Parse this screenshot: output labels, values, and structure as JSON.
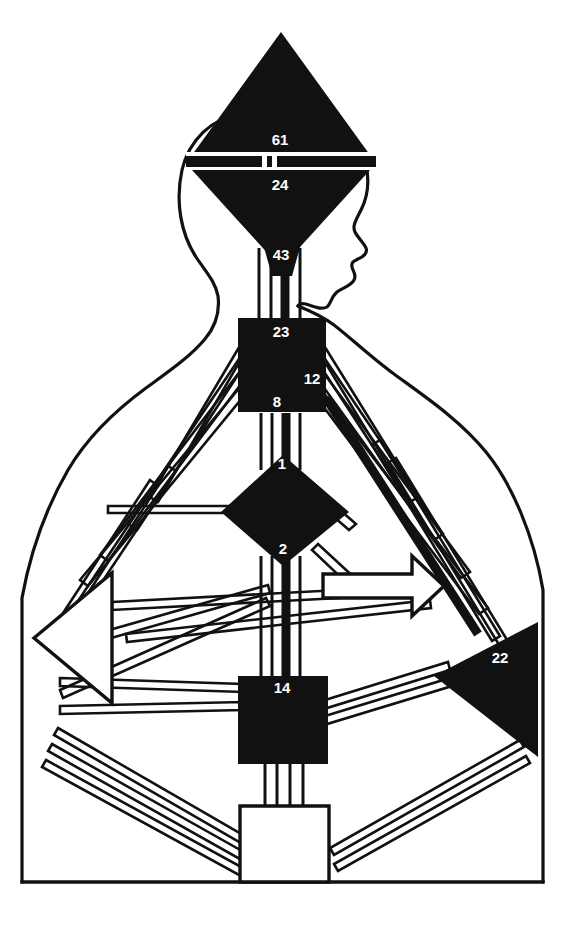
{
  "figure": {
    "background_color": "#ffffff",
    "ink_color": "#111111",
    "label_color": "#ffffff",
    "width": 578,
    "height": 926
  },
  "nodes": [
    {
      "id": "node-61",
      "label": "61",
      "shape": "triangle-up",
      "region": "upper-head",
      "fill": "#111111",
      "label_x": 280,
      "label_y": 141
    },
    {
      "id": "node-24",
      "label": "24",
      "shape": "triangle-down",
      "region": "mid-head",
      "fill": "#111111",
      "label_x": 280,
      "label_y": 186
    },
    {
      "id": "node-43",
      "label": "43",
      "shape": "taper",
      "region": "lower-head-neck",
      "fill": "#111111",
      "label_x": 281,
      "label_y": 256
    },
    {
      "id": "node-23",
      "label": "23",
      "shape": "square",
      "region": "upper-thorax",
      "fill": "#111111",
      "label_x": 281,
      "label_y": 333
    },
    {
      "id": "node-12",
      "label": "12",
      "shape": "square",
      "region": "right-thorax",
      "fill": "#111111",
      "label_x": 312,
      "label_y": 380
    },
    {
      "id": "node-8",
      "label": "8",
      "shape": "square",
      "region": "lower-thorax",
      "fill": "#111111",
      "label_x": 277,
      "label_y": 403
    },
    {
      "id": "node-1",
      "label": "1",
      "shape": "diamond",
      "region": "upper-abdomen",
      "fill": "#111111",
      "label_x": 282,
      "label_y": 465
    },
    {
      "id": "node-2",
      "label": "2",
      "shape": "diamond",
      "region": "lower-abdomen",
      "fill": "#111111",
      "label_x": 283,
      "label_y": 550
    },
    {
      "id": "node-14",
      "label": "14",
      "shape": "square",
      "region": "pelvis",
      "fill": "#111111",
      "label_x": 282,
      "label_y": 689
    },
    {
      "id": "node-22",
      "label": "22",
      "shape": "triangle-left",
      "region": "right-flank",
      "fill": "#111111",
      "label_x": 500,
      "label_y": 659
    }
  ],
  "unlabeled_nodes": [
    {
      "id": "node-open-left",
      "shape": "triangle-left-open",
      "region": "left-flank",
      "fill": "#ffffff"
    },
    {
      "id": "node-open-bottom",
      "shape": "square-open",
      "region": "base",
      "fill": "#ffffff"
    },
    {
      "id": "node-open-right-arrow",
      "shape": "arrow-right-open",
      "region": "mid-right",
      "fill": "#ffffff"
    }
  ]
}
